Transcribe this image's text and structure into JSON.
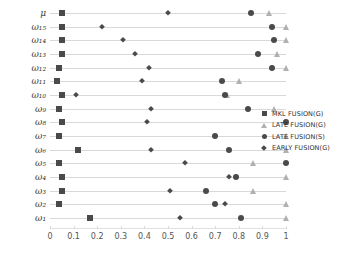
{
  "chart_data": {
    "type": "scatter",
    "title": "",
    "xlabel": "",
    "ylabel": "",
    "xlim": [
      0,
      1
    ],
    "ylim_categories_order": "top-to-bottom",
    "grid": true,
    "legend_position": "right",
    "xticks": [
      "0",
      "0.1",
      "0.2",
      "0.3",
      "0.4",
      "0.5",
      "0.6",
      "0.7",
      "0.8",
      "0.9",
      "1"
    ],
    "xtick_values": [
      0,
      0.1,
      0.2,
      0.3,
      0.4,
      0.5,
      0.6,
      0.7,
      0.8,
      0.9,
      1
    ],
    "categories": [
      "μ",
      "ω₁₅",
      "ω₁₄",
      "ω₁₃",
      "ω₁₂",
      "ω₁₁",
      "ω₁₀",
      "ω₉",
      "ω₈",
      "ω₇",
      "ω₆",
      "ω₅",
      "ω₄",
      "ω₃",
      "ω₂",
      "ω₁"
    ],
    "series": [
      {
        "name": "MKL FUSION(G)",
        "marker": "square",
        "color": "#4a4a4a",
        "values": [
          0.05,
          0.05,
          0.05,
          0.05,
          0.04,
          0.03,
          0.05,
          0.04,
          0.05,
          0.04,
          0.12,
          0.04,
          0.05,
          0.05,
          0.04,
          0.17
        ]
      },
      {
        "name": "LATE FUSION(G)",
        "marker": "triangle",
        "color": "#b0b0b0",
        "values": [
          0.93,
          1.0,
          1.0,
          0.96,
          1.0,
          0.8,
          0.75,
          0.95,
          1.0,
          1.0,
          1.0,
          0.86,
          1.0,
          0.86,
          1.0,
          1.0
        ]
      },
      {
        "name": "LATE FUSION(S)",
        "marker": "circle",
        "color": "#4a4a4a",
        "values": [
          0.85,
          0.94,
          0.95,
          0.88,
          0.94,
          0.73,
          0.74,
          0.84,
          1.0,
          0.7,
          0.76,
          1.0,
          0.79,
          0.66,
          0.7,
          0.81
        ]
      },
      {
        "name": "EARLY FUSION(G)",
        "marker": "diamond",
        "color": "#4a4a4a",
        "values": [
          0.5,
          0.22,
          0.31,
          0.36,
          0.42,
          0.39,
          0.11,
          0.43,
          0.41,
          0.04,
          0.43,
          0.57,
          0.76,
          0.51,
          0.74,
          0.55
        ]
      }
    ]
  },
  "legend": {
    "items": [
      {
        "label": "MKL FUSION(G)",
        "marker": "square"
      },
      {
        "label": "LATE FUSION(G)",
        "marker": "triangle"
      },
      {
        "label": "LATE FUSION(S)",
        "marker": "circle"
      },
      {
        "label": "EARLY FUSION(G)",
        "marker": "diamond"
      }
    ]
  }
}
